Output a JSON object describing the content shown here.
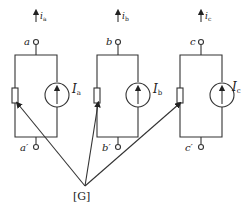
{
  "diagram": {
    "type": "circuit",
    "branches": [
      {
        "id": "a",
        "terminal_top": "a",
        "terminal_bottom": "a′",
        "current": "i",
        "current_sub": "a",
        "source": "I",
        "source_sub": "a"
      },
      {
        "id": "b",
        "terminal_top": "b",
        "terminal_bottom": "b′",
        "current": "i",
        "current_sub": "b",
        "source": "I",
        "source_sub": "b"
      },
      {
        "id": "c",
        "terminal_top": "c",
        "terminal_bottom": "c′",
        "current": "i",
        "current_sub": "c",
        "source": "I",
        "source_sub": "c"
      }
    ],
    "conductance_label": "[G]"
  }
}
